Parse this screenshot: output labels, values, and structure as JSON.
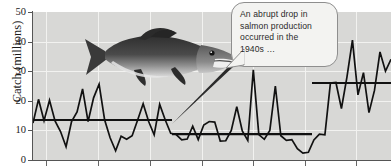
{
  "figure": {
    "kind": "line-chart-scanned-figure",
    "background_color": "#d8d8d6",
    "line_color": "#111111",
    "grid_color": "#f2f2f0",
    "axis_color": "#555555"
  },
  "annotation": {
    "callout_text": "An abrupt drop in salmon production occurred in the 1940s …",
    "callout_lines": [
      "An abrupt drop in",
      "salmon production",
      "occurred in the",
      "1940s …"
    ],
    "bubble_fill": "#f3f3f1",
    "bubble_border": "#8e8e8e",
    "leader_target": {
      "x": 172,
      "y": 124
    }
  },
  "image": {
    "salmon_photo_alt": "salmon-photograph",
    "tone": "grayscale"
  },
  "chart_data": {
    "type": "line",
    "title": "",
    "xlabel": "",
    "ylabel": "Catch (millions)",
    "ylim": [
      0,
      50
    ],
    "yticks": [
      0,
      10,
      20,
      30,
      40,
      50
    ],
    "ytick_labels": [
      "0",
      "10",
      "20",
      "30",
      "40",
      "50"
    ],
    "xticks_px": [
      46,
      98,
      150,
      202,
      253,
      305,
      356
    ],
    "xtick_labels": [],
    "grid": true,
    "grid_axis": "both",
    "legend": false,
    "series": [
      {
        "name": "Catch (millions)",
        "values": [
          12.5,
          20.5,
          13.3,
          20.2,
          13.2,
          9.6,
          4.5,
          13.0,
          16.2,
          24.0,
          13.0,
          21.0,
          25.6,
          13.6,
          7.5,
          3.1,
          8.0,
          7.0,
          8.2,
          13.5,
          19.0,
          13.0,
          8.5,
          18.8,
          13.6,
          9.0,
          8.6,
          6.8,
          7.1,
          11.4,
          6.9,
          11.8,
          13.0,
          12.8,
          6.4,
          6.5,
          10.0,
          18.0,
          9.8,
          6.6,
          30.5,
          8.6,
          7.0,
          10.0,
          25.0,
          8.2,
          6.6,
          6.9,
          3.8,
          2.3,
          2.6,
          6.8,
          8.7,
          8.5,
          26.0,
          26.2,
          17.4,
          28.0,
          40.5,
          22.0,
          29.5,
          16.0,
          23.5,
          36.5,
          30.0,
          34.0
        ]
      }
    ],
    "annotations": [
      {
        "type": "mean-line",
        "label": "period-1 mean",
        "value": 13.5,
        "x_start_px": 33,
        "x_end_px": 172
      },
      {
        "type": "mean-line",
        "label": "period-2 mean",
        "value": 8.7,
        "x_start_px": 172,
        "x_end_px": 312
      },
      {
        "type": "mean-line",
        "label": "period-3 mean",
        "value": 26.0,
        "x_start_px": 312,
        "x_end_px": 391
      }
    ]
  }
}
